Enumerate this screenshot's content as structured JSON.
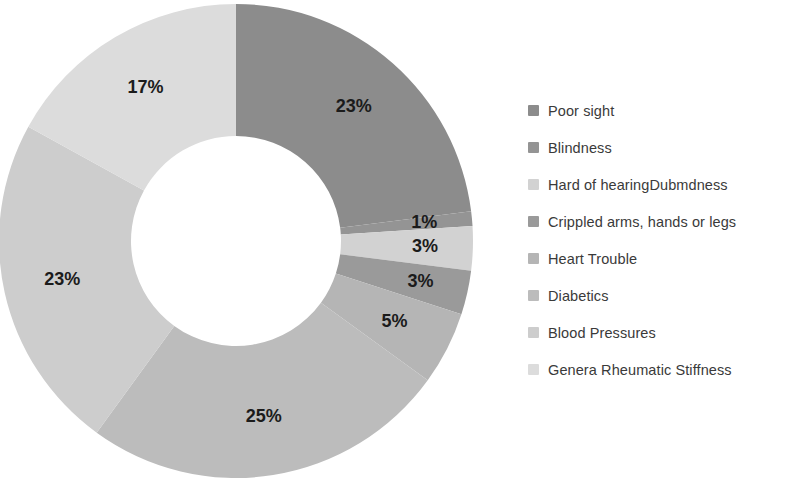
{
  "chart_data": {
    "type": "pie",
    "variant": "donut",
    "title": "",
    "subtitle": "",
    "xlabel": "",
    "ylabel": "",
    "legend_position": "right",
    "grid": false,
    "start_angle_deg": 0,
    "direction": "clockwise",
    "units": "percent",
    "categories": [
      "Poor sight",
      "Blindness",
      "Hard of hearingDubmdness",
      "Crippled arms, hands or legs",
      "Heart Trouble",
      "Diabetics",
      "Blood Pressures",
      "Genera Rheumatic Stiffness"
    ],
    "values": [
      23,
      1,
      3,
      3,
      5,
      25,
      23,
      17
    ],
    "data_labels": [
      "23%",
      "1%",
      "3%",
      "3%",
      "5%",
      "25%",
      "23%",
      "17%"
    ],
    "colors": [
      "#8c8c8c",
      "#949494",
      "#d2d2d2",
      "#9a9a9a",
      "#b5b5b5",
      "#bcbcbc",
      "#cdcdcd",
      "#dcdcdc"
    ],
    "slices": [
      {
        "label": "Poor sight",
        "value": 23,
        "data_label": "23%",
        "color": "#8c8c8c"
      },
      {
        "label": "Blindness",
        "value": 1,
        "data_label": "1%",
        "color": "#949494"
      },
      {
        "label": "Hard of hearingDubmdness",
        "value": 3,
        "data_label": "3%",
        "color": "#d2d2d2"
      },
      {
        "label": "Crippled arms, hands or legs",
        "value": 3,
        "data_label": "3%",
        "color": "#9a9a9a"
      },
      {
        "label": "Heart Trouble",
        "value": 5,
        "data_label": "5%",
        "color": "#b5b5b5"
      },
      {
        "label": "Diabetics",
        "value": 25,
        "data_label": "25%",
        "color": "#bcbcbc"
      },
      {
        "label": "Blood Pressures",
        "value": 23,
        "data_label": "23%",
        "color": "#cdcdcd"
      },
      {
        "label": "Genera Rheumatic Stiffness",
        "value": 17,
        "data_label": "17%",
        "color": "#dcdcdc"
      }
    ]
  },
  "legend": {
    "items": [
      {
        "label": "Poor sight",
        "color": "#8c8c8c"
      },
      {
        "label": "Blindness",
        "color": "#949494"
      },
      {
        "label": "Hard of hearingDubmdness",
        "color": "#d2d2d2"
      },
      {
        "label": "Crippled arms, hands or legs",
        "color": "#9a9a9a"
      },
      {
        "label": "Heart Trouble",
        "color": "#b5b5b5"
      },
      {
        "label": "Diabetics",
        "color": "#bcbcbc"
      },
      {
        "label": "Blood Pressures",
        "color": "#cdcdcd"
      },
      {
        "label": "Genera Rheumatic Stiffness",
        "color": "#dcdcdc"
      }
    ]
  },
  "geometry": {
    "center_x": 236,
    "center_y": 241,
    "outer_radius": 237,
    "inner_radius": 105,
    "label_radius": 178
  }
}
